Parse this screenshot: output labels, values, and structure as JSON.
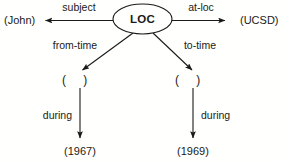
{
  "diagram": {
    "type": "semantic-network",
    "background_color": "#fffffd",
    "line_color": "#1a1a18",
    "center_node": {
      "label": "LOC",
      "shape": "ellipse"
    },
    "nodes": [
      {
        "id": "john",
        "label": "(John)",
        "shape": "text"
      },
      {
        "id": "ucsd",
        "label": "(UCSD)",
        "shape": "text"
      },
      {
        "id": "from_slot",
        "label": "( )",
        "shape": "text"
      },
      {
        "id": "to_slot",
        "label": "( )",
        "shape": "text"
      },
      {
        "id": "y1967",
        "label": "(1967)",
        "shape": "text"
      },
      {
        "id": "y1969",
        "label": "(1969)",
        "shape": "text"
      }
    ],
    "edges": [
      {
        "id": "subject",
        "label": "subject",
        "from": "LOC",
        "to": "john",
        "direction": "left"
      },
      {
        "id": "at_loc",
        "label": "at-loc",
        "from": "LOC",
        "to": "ucsd",
        "direction": "right"
      },
      {
        "id": "from_time",
        "label": "from-time",
        "from": "LOC",
        "to": "from_slot",
        "direction": "down-left"
      },
      {
        "id": "to_time",
        "label": "to-time",
        "from": "LOC",
        "to": "to_slot",
        "direction": "down-right"
      },
      {
        "id": "during_left",
        "label": "during",
        "from": "from_slot",
        "to": "y1967",
        "direction": "down"
      },
      {
        "id": "during_right",
        "label": "during",
        "from": "to_slot",
        "to": "y1969",
        "direction": "down"
      }
    ]
  }
}
